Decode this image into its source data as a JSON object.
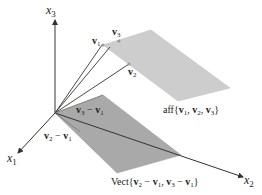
{
  "axes": {
    "x1": {
      "name": "x",
      "sub": "1"
    },
    "x2": {
      "name": "x",
      "sub": "2"
    },
    "x3": {
      "name": "x",
      "sub": "3"
    }
  },
  "points": {
    "v1": {
      "name": "v",
      "sub": "1"
    },
    "v2": {
      "name": "v",
      "sub": "2"
    },
    "v3": {
      "name": "v",
      "sub": "3"
    }
  },
  "vectors": {
    "v3_minus_v1": {
      "a": "v",
      "a_sub": "3",
      "op": " − ",
      "b": "v",
      "b_sub": "1"
    },
    "v2_minus_v1": {
      "a": "v",
      "a_sub": "2",
      "op": " − ",
      "b": "v",
      "b_sub": "1"
    }
  },
  "planes": {
    "affine": {
      "prefix": "aff{",
      "label": "aff{v1, v2, v3}",
      "color": "#c8c8c8"
    },
    "vect": {
      "prefix": "Vect{",
      "label": "Vect{v2 − v1, v3 − v1}",
      "color": "#a9a9a9"
    }
  },
  "colors": {
    "axis": "#333333",
    "affine_plane": "#cdcdcd",
    "vect_plane": "#a8a8a8",
    "point_marker": "#9a9a9a"
  }
}
